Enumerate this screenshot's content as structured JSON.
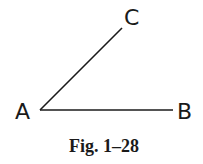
{
  "figure": {
    "caption": "Fig. 1–28",
    "points": {
      "A": {
        "label": "A",
        "x": 40,
        "y": 110
      },
      "B": {
        "label": "B",
        "x": 173,
        "y": 110
      },
      "C": {
        "label": "C",
        "x": 122,
        "y": 28
      }
    },
    "segments": [
      {
        "from": "A",
        "to": "B"
      },
      {
        "from": "A",
        "to": "C"
      }
    ],
    "line_color": "#1a1a1a"
  }
}
